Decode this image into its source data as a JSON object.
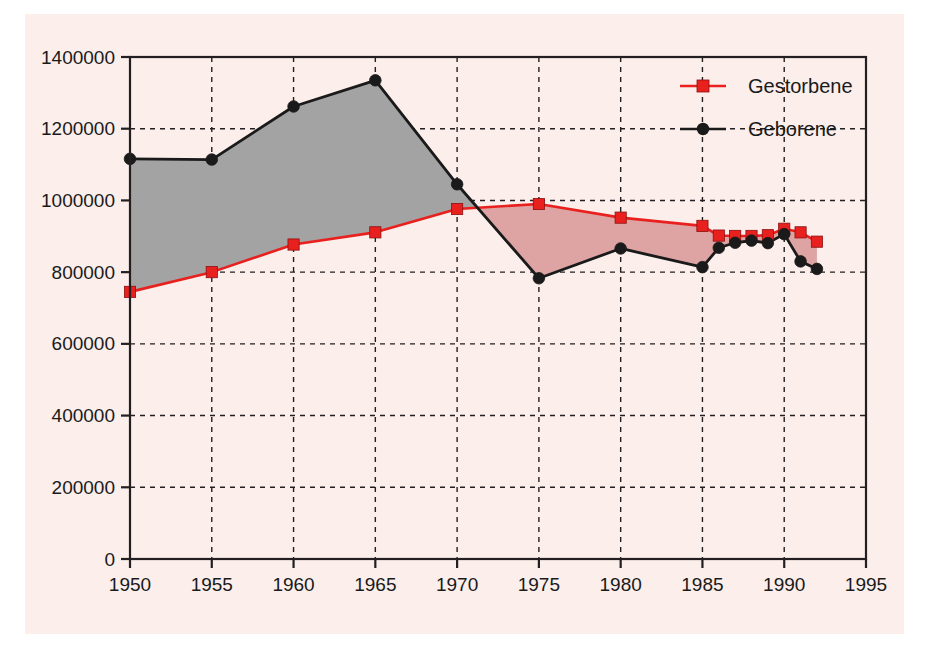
{
  "figure": {
    "background_color": "#ffffff",
    "plate_color": "#fbeeeb",
    "axis_color": "#231f20",
    "grid_color": "#231f20"
  },
  "chart_data": {
    "type": "line",
    "title": "",
    "subtitle": "",
    "xlabel": "",
    "ylabel": "",
    "xlim": [
      1950,
      1995
    ],
    "ylim": [
      0,
      1400000
    ],
    "grid": true,
    "grid_style": "dashed",
    "legend_position": "top-right",
    "x_tick_labels": [
      "1950",
      "1955",
      "1960",
      "1965",
      "1970",
      "1975",
      "1980",
      "1985",
      "1990",
      "1995"
    ],
    "x_ticks": [
      1950,
      1955,
      1960,
      1965,
      1970,
      1975,
      1980,
      1985,
      1990,
      1995
    ],
    "y_tick_labels": [
      "0",
      "200000",
      "400000",
      "600000",
      "800000",
      "1000000",
      "1200000",
      "1400000"
    ],
    "y_ticks": [
      0,
      200000,
      400000,
      600000,
      800000,
      1000000,
      1200000,
      1400000
    ],
    "series": [
      {
        "name": "Gestorbene",
        "color": "#e8201e",
        "marker": "square",
        "marker_color": "#e8201e",
        "x": [
          1950,
          1955,
          1960,
          1965,
          1970,
          1975,
          1980,
          1985,
          1986,
          1987,
          1988,
          1989,
          1990,
          1991,
          1992
        ],
        "values": [
          745000,
          800000,
          877000,
          911000,
          976000,
          990000,
          952000,
          929000,
          902000,
          901000,
          901000,
          903000,
          921000,
          911000,
          885000
        ]
      },
      {
        "name": "Geborene",
        "color": "#1a1a1a",
        "marker": "circle",
        "marker_color": "#1a1a1a",
        "x": [
          1950,
          1955,
          1960,
          1965,
          1970,
          1975,
          1980,
          1985,
          1986,
          1987,
          1988,
          1989,
          1990,
          1991,
          1992
        ],
        "values": [
          1116000,
          1114000,
          1262000,
          1335000,
          1045000,
          783000,
          866000,
          814000,
          868000,
          882000,
          888000,
          881000,
          906000,
          830000,
          809000
        ]
      }
    ],
    "fills": [
      {
        "name": "gestorbene-below-geborene",
        "color": "#a3a3a3",
        "description": "grey area where Geborene exceeds Gestorbene (1950-1971)"
      },
      {
        "name": "geborene-below-gestorbene",
        "color": "#dea4a3",
        "description": "pink area where Gestorbene exceeds Geborene (1971-1992)"
      }
    ]
  },
  "legend": {
    "entries": [
      {
        "label": "Gestorbene",
        "color": "#e8201e",
        "marker": "square"
      },
      {
        "label": "Geborene",
        "color": "#1a1a1a",
        "marker": "circle"
      }
    ]
  }
}
